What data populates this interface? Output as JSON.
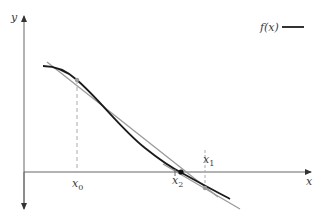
{
  "diagram": {
    "axes": {
      "x_label": "x",
      "y_label": "y"
    },
    "legend": {
      "label": "f(x)",
      "line_color": "#333333"
    },
    "points": {
      "x0": {
        "label": "x",
        "subscript": "0"
      },
      "x1": {
        "label": "x",
        "subscript": "1"
      },
      "x2": {
        "label": "x",
        "subscript": "2"
      }
    },
    "colors": {
      "curve": "#1a1a1a",
      "tangent": "#9a9a9a",
      "axis": "#555555",
      "dashed": "#aaaaaa",
      "point_on_curve": "#999999",
      "root_point": "#111111"
    }
  }
}
